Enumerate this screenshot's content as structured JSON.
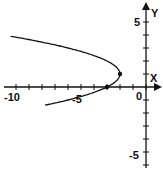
{
  "chart_data": {
    "type": "line",
    "title": "",
    "xlabel": "X",
    "ylabel": "Y",
    "xlim": [
      -10.5,
      1
    ],
    "ylim": [
      -5.5,
      5.5
    ],
    "x_ticks_labeled": [
      "-10",
      "-5",
      "0"
    ],
    "y_ticks_labeled": [
      "5",
      "-5"
    ],
    "grid": false,
    "series": [
      {
        "name": "parabola x = -(y-1)^2 - 2",
        "x": [
          -10.6,
          -8.25,
          -6.0,
          -4.25,
          -3.0,
          -2.25,
          -2.0,
          -2.25,
          -3.0,
          -4.25,
          -6.0,
          -7.8
        ],
        "y": [
          3.9,
          3.5,
          3.0,
          2.5,
          2.0,
          1.5,
          1.0,
          0.5,
          0.0,
          -0.5,
          -1.0,
          -1.4
        ]
      }
    ],
    "points": [
      {
        "x": -2,
        "y": 1
      },
      {
        "x": -3,
        "y": 0
      }
    ]
  },
  "labels": {
    "x_axis": "X",
    "y_axis": "Y",
    "x_neg10": "-10",
    "x_neg5": "-5",
    "x_0": "0",
    "y_5": "5",
    "y_neg5": "-5"
  }
}
